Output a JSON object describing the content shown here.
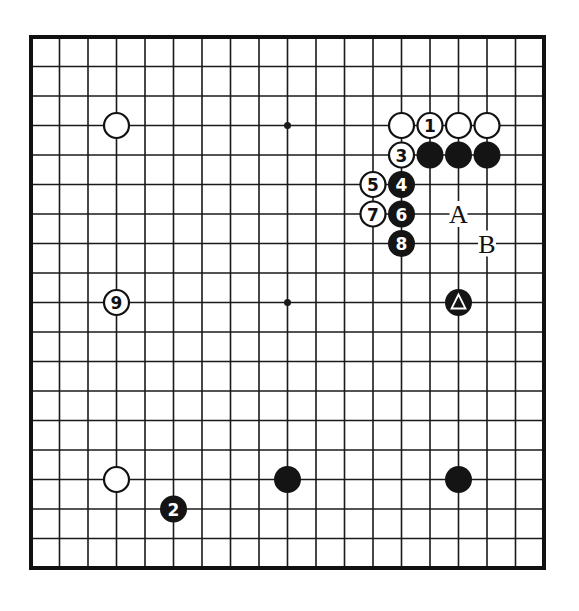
{
  "diagram": {
    "type": "go-board",
    "size": 19,
    "colors": {
      "line": "#1a1a1a",
      "border": "#111111",
      "black_stone": "#141414",
      "white_stone": "#ffffff",
      "background": "#ffffff"
    },
    "star_points": [
      [
        3,
        3
      ],
      [
        9,
        3
      ],
      [
        15,
        3
      ],
      [
        3,
        9
      ],
      [
        9,
        9
      ],
      [
        15,
        9
      ],
      [
        3,
        15
      ],
      [
        9,
        15
      ],
      [
        15,
        15
      ]
    ],
    "stones": [
      {
        "color": "white",
        "col": 3,
        "row": 3,
        "label": ""
      },
      {
        "color": "white",
        "col": 13,
        "row": 3,
        "label": ""
      },
      {
        "color": "white",
        "col": 14,
        "row": 3,
        "label": "1"
      },
      {
        "color": "white",
        "col": 15,
        "row": 3,
        "label": ""
      },
      {
        "color": "white",
        "col": 16,
        "row": 3,
        "label": ""
      },
      {
        "color": "white",
        "col": 13,
        "row": 4,
        "label": "3"
      },
      {
        "color": "black",
        "col": 14,
        "row": 4,
        "label": ""
      },
      {
        "color": "black",
        "col": 15,
        "row": 4,
        "label": ""
      },
      {
        "color": "black",
        "col": 16,
        "row": 4,
        "label": ""
      },
      {
        "color": "white",
        "col": 12,
        "row": 5,
        "label": "5"
      },
      {
        "color": "black",
        "col": 13,
        "row": 5,
        "label": "4"
      },
      {
        "color": "white",
        "col": 12,
        "row": 6,
        "label": "7"
      },
      {
        "color": "black",
        "col": 13,
        "row": 6,
        "label": "6"
      },
      {
        "color": "black",
        "col": 13,
        "row": 7,
        "label": "8"
      },
      {
        "color": "white",
        "col": 3,
        "row": 9,
        "label": "9"
      },
      {
        "color": "black",
        "col": 15,
        "row": 9,
        "label": "triangle"
      },
      {
        "color": "white",
        "col": 3,
        "row": 15,
        "label": ""
      },
      {
        "color": "black",
        "col": 9,
        "row": 15,
        "label": ""
      },
      {
        "color": "black",
        "col": 15,
        "row": 15,
        "label": ""
      },
      {
        "color": "black",
        "col": 5,
        "row": 16,
        "label": "2"
      }
    ],
    "letters": [
      {
        "text": "A",
        "col": 15,
        "row": 6
      },
      {
        "text": "B",
        "col": 16,
        "row": 7
      }
    ]
  }
}
